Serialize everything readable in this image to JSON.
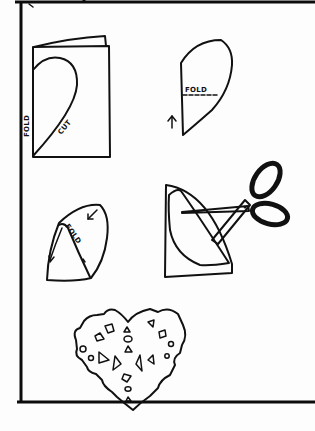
{
  "illustration": {
    "title": "Folded paper heart cutting instructions",
    "ink_color": "#111111",
    "paper_color": "#fdfdfd",
    "steps": [
      {
        "id": 1,
        "description": "Folded sheet of paper with half-heart outline drawn along fold",
        "labels": {
          "fold": "FOLD",
          "cut": "CUT"
        }
      },
      {
        "id": 2,
        "description": "Unfolded half heart shape with dashed fold line and upward arrow",
        "labels": {
          "fold": "FOLD"
        }
      },
      {
        "id": 3,
        "description": "Half heart folded into a cone shape with arrow",
        "labels": {
          "fold": "FOLD"
        }
      },
      {
        "id": 4,
        "description": "Scissors cutting small shapes from the folded cone",
        "labels": {}
      },
      {
        "id": 5,
        "description": "Finished heart with cut-out diamonds, triangles and circles",
        "labels": {}
      }
    ]
  }
}
